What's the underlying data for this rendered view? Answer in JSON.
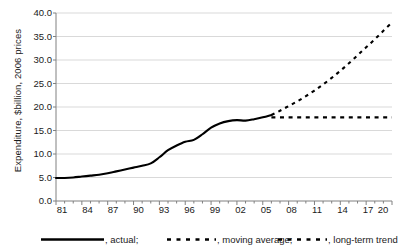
{
  "chart_data": {
    "type": "line",
    "title": "",
    "subtitle": "",
    "xlabel": "",
    "ylabel": "Expenditure, $billion, 2006 prices",
    "xlim": [
      81,
      20
    ],
    "ylim": [
      0.0,
      40.0
    ],
    "ytick_step": 5.0,
    "grid": "horizontal",
    "legend_position": "bottom",
    "x_tick_labels": [
      "81",
      "84",
      "87",
      "90",
      "93",
      "96",
      "99",
      "02",
      "05",
      "08",
      "11",
      "14",
      "17",
      "20"
    ],
    "y_tick_labels": [
      "0.0",
      "5.0",
      "10.0",
      "15.0",
      "20.0",
      "25.0",
      "30.0",
      "35.0",
      "40.0"
    ],
    "x_minor_ticks_every_years": 1,
    "series": [
      {
        "name": ", actual;",
        "style": "solid",
        "x": [
          1981,
          1982,
          1983,
          1984,
          1985,
          1986,
          1987,
          1988,
          1989,
          1990,
          1991,
          1992,
          1993,
          1994,
          1995,
          1996,
          1997,
          1998,
          1999,
          2000,
          2001,
          2002,
          2003,
          2004,
          2005,
          2006
        ],
        "values": [
          4.9,
          4.9,
          5.0,
          5.2,
          5.4,
          5.6,
          5.9,
          6.3,
          6.7,
          7.1,
          7.5,
          8.0,
          9.3,
          10.8,
          11.8,
          12.6,
          13.0,
          14.2,
          15.6,
          16.5,
          17.0,
          17.2,
          17.1,
          17.4,
          17.8,
          18.3
        ]
      },
      {
        "name": ", moving average;",
        "style": "dashed",
        "x": [
          2006,
          2007,
          2008,
          2009,
          2010,
          2011,
          2012,
          2013,
          2014,
          2015,
          2016,
          2017,
          2018,
          2019,
          2020
        ],
        "values": [
          18.3,
          19.2,
          20.2,
          21.2,
          22.3,
          23.5,
          24.8,
          26.2,
          27.7,
          29.3,
          31.0,
          32.7,
          34.4,
          36.2,
          38.0
        ]
      },
      {
        "name": ", long-term trend",
        "style": "dashed",
        "x": [
          2006,
          2020
        ],
        "values": [
          17.8,
          17.8
        ]
      }
    ],
    "colors": {
      "line": "#000000",
      "grid": "#d9d9d9",
      "axis": "#808080",
      "text": "#1a1a1a",
      "background": "#ffffff"
    }
  },
  "legend": {
    "items": [
      {
        "label": ", actual;",
        "style": "solid"
      },
      {
        "label": ", moving average;",
        "style": "dashed"
      },
      {
        "label": ", long-term trend",
        "style": "dashed"
      }
    ]
  }
}
